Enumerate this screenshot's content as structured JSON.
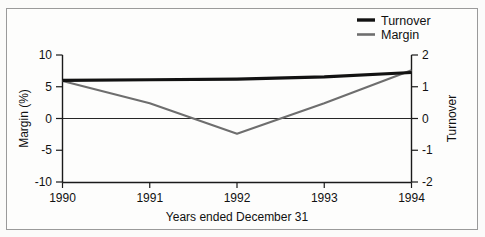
{
  "chart_data": {
    "type": "line",
    "title": "",
    "xlabel": "Years ended December 31",
    "ylabel": "Margin (%)",
    "y2label": "Turnover",
    "categories": [
      "1990",
      "1991",
      "1992",
      "1993",
      "1994"
    ],
    "x": [
      1990,
      1991,
      1992,
      1993,
      1994
    ],
    "xlim": [
      1990,
      1994
    ],
    "ylim": [
      -10,
      10
    ],
    "y2lim": [
      -2,
      2
    ],
    "yticks": [
      "10",
      "5",
      "0",
      "-5",
      "-10"
    ],
    "ytick_values": [
      10,
      5,
      0,
      -5,
      -10
    ],
    "y2ticks": [
      "2",
      "1",
      "0",
      "-1",
      "-2"
    ],
    "y2tick_values": [
      2,
      1,
      0,
      -1,
      -2
    ],
    "grid": false,
    "zero_line": true,
    "legend_position": "top-right",
    "series": [
      {
        "name": "Turnover",
        "axis": "right",
        "color": "#121212",
        "values": [
          1.2,
          1.22,
          1.24,
          1.31,
          1.45
        ]
      },
      {
        "name": "Margin",
        "axis": "left",
        "color": "#6e6e6e",
        "values": [
          5.9,
          2.4,
          -2.4,
          2.4,
          7.6
        ]
      }
    ]
  },
  "legend": {
    "items": [
      {
        "label": "Turnover",
        "swatch": "line-swatch-black"
      },
      {
        "label": "Margin",
        "swatch": "line-swatch-gray"
      }
    ]
  },
  "axes": {
    "left_title": "Margin (%)",
    "right_title": "Turnover",
    "bottom_title": "Years ended December 31",
    "left_ticks": [
      "10",
      "5",
      "0",
      "-5",
      "-10"
    ],
    "right_ticks": [
      "2",
      "1",
      "0",
      "-1",
      "-2"
    ],
    "x_ticks": [
      "1990",
      "1991",
      "1992",
      "1993",
      "1994"
    ]
  },
  "colors": {
    "turnover": "#121212",
    "margin": "#6e6e6e",
    "axis": "#1a1a1a",
    "frame": "#9a9a9a",
    "background": "#fdfdfc"
  }
}
